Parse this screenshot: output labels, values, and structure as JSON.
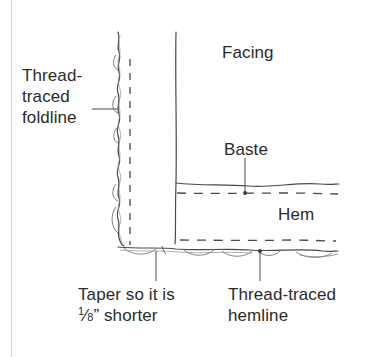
{
  "figure": {
    "kind": "sewing-diagram",
    "ink_color": "#3a3a3a",
    "text_color": "#2b2b2b",
    "rule_color": "#d8d8d8",
    "background": "#ffffff"
  },
  "labels": {
    "foldline": "Thread-\ntraced\nfoldline",
    "foldline_plain": "Thread-traced foldline",
    "facing": "Facing",
    "baste": "Baste",
    "hem": "Hem",
    "taper_line1": "Taper so it is",
    "taper_fraction_numerator": "1",
    "taper_fraction_denominator": "8",
    "taper_unit": "”",
    "taper_line2_tail": " shorter",
    "taper_plain": "Taper so it is 1/8” shorter",
    "hemline": "Thread-traced\nhemline",
    "hemline_plain": "Thread-traced hemline"
  },
  "leaders": [
    {
      "name": "foldline-leader",
      "from": "Thread-traced foldline",
      "to": "folded edge"
    },
    {
      "name": "baste-leader",
      "from": "Baste",
      "to": "dashed basting line"
    },
    {
      "name": "taper-leader",
      "from": "Taper so it is 1/8” shorter",
      "to": "hem corner"
    },
    {
      "name": "hemline-leader",
      "from": "Thread-traced hemline",
      "to": "dashed hemline"
    }
  ]
}
